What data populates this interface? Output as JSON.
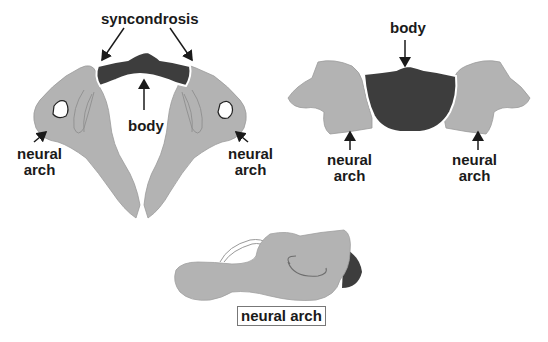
{
  "colors": {
    "bone": "#b3b3b3",
    "body": "#3d3d3d",
    "outline": "#7a7a7a",
    "text": "#1a1a1a",
    "background": "#ffffff"
  },
  "panels": [
    {
      "id": "axial-view-left",
      "labels": {
        "syncondrosis": "syncondrosis",
        "body": "body",
        "left_arch_line1": "neural",
        "left_arch_line2": "arch",
        "right_arch_line1": "neural",
        "right_arch_line2": "arch"
      }
    },
    {
      "id": "coronal-view-right",
      "labels": {
        "body": "body",
        "left_arch_line1": "neural",
        "left_arch_line2": "arch",
        "right_arch_line1": "neural",
        "right_arch_line2": "arch"
      }
    },
    {
      "id": "lateral-view-bottom",
      "labels": {
        "arch": "neural arch"
      }
    }
  ]
}
